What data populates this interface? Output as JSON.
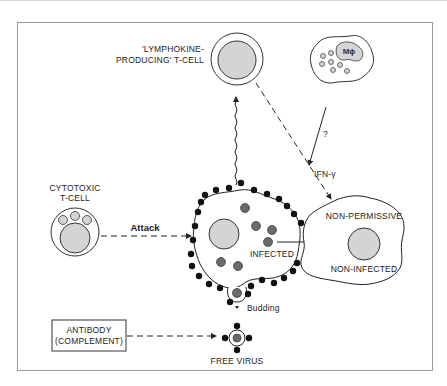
{
  "diagram": {
    "labels": {
      "lymphokine_line1": "'LYMPHOKINE-",
      "lymphokine_line2": "PRODUCING' T-CELL",
      "macrophage": "Mϕ",
      "question": "?",
      "ifn": "IFN-γ",
      "cytotoxic_line1": "CYTOTOXIC",
      "cytotoxic_line2": "T-CELL",
      "attack": "Attack",
      "infected": "INFECTED",
      "non_permissive": "NON-PERMISSIVE",
      "non_infected": "NON-INFECTED",
      "budding": "Budding",
      "antibody_line1": "ANTIBODY",
      "antibody_line2": "(COMPLEMENT)",
      "free_virus": "FREE VIRUS"
    },
    "colors": {
      "nucleus_fill": "#d4d4d4",
      "virus_fill": "#6a6a6a",
      "spike_fill": "#111111",
      "line": "#222222",
      "frame": "#9a9a9a"
    }
  }
}
